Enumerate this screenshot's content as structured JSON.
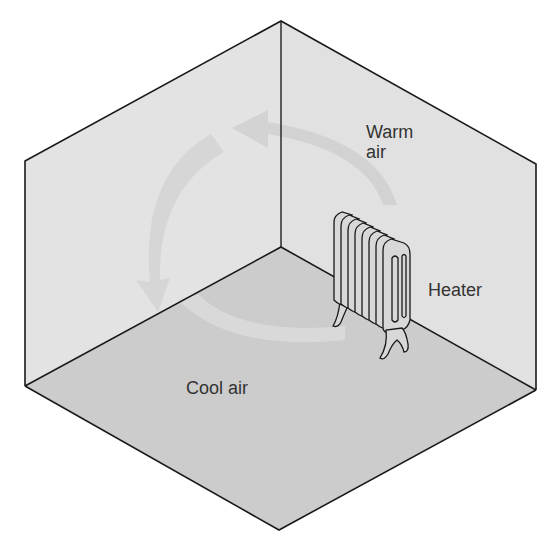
{
  "labels": {
    "warm_air_line1": "Warm",
    "warm_air_line2": "air",
    "heater": "Heater",
    "cool_air": "Cool air"
  },
  "colors": {
    "wall": "#e3e3e3",
    "floor": "#cccccc",
    "outline": "#1a1a1a",
    "arrow_on_wall": "#d0d0d0",
    "arrow_on_floor": "#d9d9d9",
    "heater_fill": "#d8d8d8",
    "text": "#333333"
  },
  "diagram": {
    "components": [
      "left-wall",
      "right-wall",
      "floor",
      "heater",
      "circulation-arrows"
    ]
  }
}
